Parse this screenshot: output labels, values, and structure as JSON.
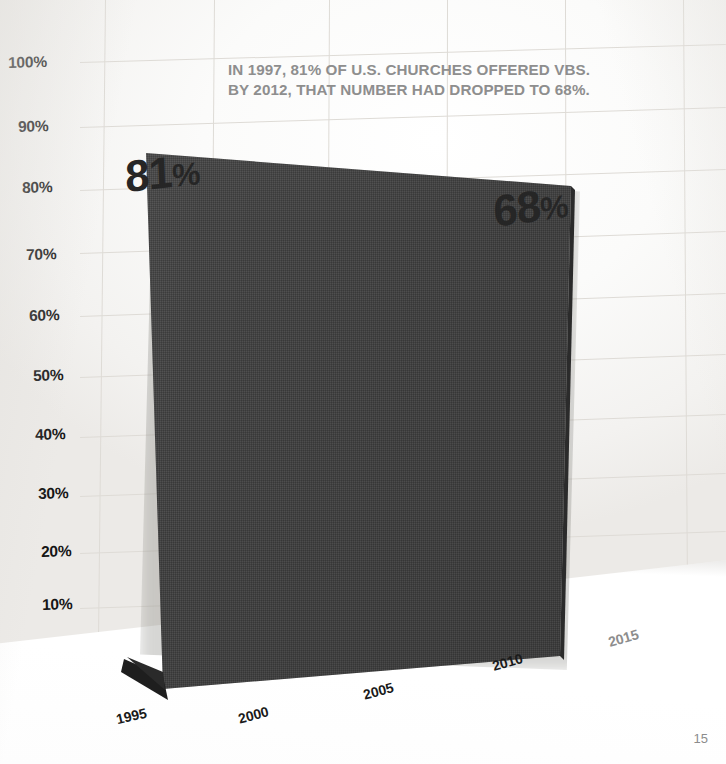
{
  "headline": {
    "line1": "IN 1997, 81% OF U.S. CHURCHES OFFERED VBS.",
    "line2": "BY 2012, THAT NUMBER HAD DROPPED TO 68%.",
    "color": "#8e8e8e"
  },
  "page": {
    "number": "15"
  },
  "colors": {
    "board": "#3f3f3f",
    "wall": "#fbfbfa",
    "grid": "#dedbd6",
    "axis_text": "#161616",
    "dim_text": "#8d8d8d"
  },
  "chart_data": {
    "type": "area",
    "title": "IN 1997, 81% OF U.S. CHURCHES OFFERED VBS. BY 2012, THAT NUMBER HAD DROPPED TO 68%.",
    "xlabel": "",
    "ylabel": "",
    "x": [
      1997,
      2012
    ],
    "values": [
      81,
      68
    ],
    "point_labels": [
      "81%",
      "68%"
    ],
    "ylim": [
      0,
      100
    ],
    "ytick_labels": [
      "100%",
      "90%",
      "80%",
      "70%",
      "60%",
      "50%",
      "40%",
      "30%",
      "20%",
      "10%"
    ],
    "ytick_values": [
      100,
      90,
      80,
      70,
      60,
      50,
      40,
      30,
      20,
      10
    ],
    "xtick_labels": [
      "1995",
      "2000",
      "2005",
      "2010",
      "2015"
    ],
    "xtick_values": [
      1995,
      2000,
      2005,
      2010,
      2015
    ],
    "grid": true,
    "legend": "none",
    "annotations": [
      "81%",
      "68%"
    ],
    "note": "Photographed physical chart; dark textured board rendered in perspective against a gridded wall."
  },
  "y_axis": {
    "ticks": [
      {
        "label": "100%",
        "x": 8,
        "y": 54,
        "rot": -1.5
      },
      {
        "label": "90%",
        "x": 18,
        "y": 118,
        "rot": -1.5
      },
      {
        "label": "80%",
        "x": 22,
        "y": 179,
        "rot": -1.5
      },
      {
        "label": "70%",
        "x": 26,
        "y": 246,
        "rot": -1.5
      },
      {
        "label": "60%",
        "x": 29,
        "y": 307,
        "rot": -1.5
      },
      {
        "label": "50%",
        "x": 33,
        "y": 367,
        "rot": -1.5
      },
      {
        "label": "40%",
        "x": 35,
        "y": 426,
        "rot": -1.5
      },
      {
        "label": "30%",
        "x": 38,
        "y": 485,
        "rot": -1.5
      },
      {
        "label": "20%",
        "x": 41,
        "y": 543,
        "rot": -1.5
      },
      {
        "label": "10%",
        "x": 42,
        "y": 596,
        "rot": -1.5
      }
    ]
  },
  "x_axis": {
    "ticks": [
      {
        "label": "1995",
        "x": 116,
        "y": 708,
        "rot": -13,
        "dim": false
      },
      {
        "label": "2000",
        "x": 238,
        "y": 707,
        "rot": -15,
        "dim": false
      },
      {
        "label": "2005",
        "x": 363,
        "y": 683,
        "rot": -15,
        "dim": false
      },
      {
        "label": "2010",
        "x": 492,
        "y": 654,
        "rot": -16,
        "dim": false
      },
      {
        "label": "2015",
        "x": 608,
        "y": 630,
        "rot": -16,
        "dim": true
      }
    ]
  },
  "value_labels": [
    {
      "num": "81",
      "pct": "%",
      "x": 126,
      "y": 155,
      "rot": -6,
      "skew": -4
    },
    {
      "num": "68",
      "pct": "%",
      "x": 495,
      "y": 190,
      "rot": -8,
      "skew": -4
    }
  ],
  "grid_lines": {
    "vertical": [
      {
        "x1": 106,
        "y1": 0,
        "x2": 99,
        "y2": 640
      },
      {
        "x1": 215,
        "y1": 0,
        "x2": 210,
        "y2": 630
      },
      {
        "x1": 330,
        "y1": 0,
        "x2": 327,
        "y2": 620
      },
      {
        "x1": 448,
        "y1": 0,
        "x2": 447,
        "y2": 610
      },
      {
        "x1": 566,
        "y1": 0,
        "x2": 567,
        "y2": 600
      },
      {
        "x1": 684,
        "y1": 0,
        "x2": 688,
        "y2": 592
      }
    ],
    "horizontal": [
      {
        "x1": 80,
        "y1": 62,
        "x2": 726,
        "y2": 44
      },
      {
        "x1": 80,
        "y1": 127,
        "x2": 726,
        "y2": 107
      },
      {
        "x1": 80,
        "y1": 190,
        "x2": 726,
        "y2": 169
      },
      {
        "x1": 80,
        "y1": 253,
        "x2": 726,
        "y2": 231
      },
      {
        "x1": 80,
        "y1": 316,
        "x2": 726,
        "y2": 293
      },
      {
        "x1": 80,
        "y1": 377,
        "x2": 726,
        "y2": 354
      },
      {
        "x1": 80,
        "y1": 437,
        "x2": 726,
        "y2": 414
      },
      {
        "x1": 80,
        "y1": 496,
        "x2": 726,
        "y2": 473
      },
      {
        "x1": 80,
        "y1": 553,
        "x2": 726,
        "y2": 531
      },
      {
        "x1": 80,
        "y1": 608,
        "x2": 726,
        "y2": 587
      }
    ]
  }
}
